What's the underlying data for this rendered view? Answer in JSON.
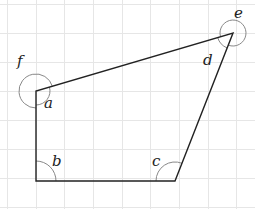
{
  "diagram": {
    "type": "quadrilateral-on-grid",
    "colors": {
      "grid": "#e6e6e6",
      "edge": "#222222",
      "arc": "#888888",
      "label": "#222222"
    },
    "grid": {
      "x_lines": [
        7,
        36,
        64,
        93,
        122,
        150,
        179,
        208,
        236
      ],
      "y_lines": [
        4,
        33,
        62,
        91,
        120,
        149,
        178,
        207
      ]
    },
    "vertices": {
      "A": [
        36,
        91
      ],
      "B": [
        36,
        181
      ],
      "C": [
        175,
        181
      ],
      "D": [
        233,
        33
      ]
    },
    "angle_labels": {
      "a": "a",
      "b": "b",
      "c": "c",
      "d": "d",
      "e": "e",
      "f": "f"
    }
  }
}
